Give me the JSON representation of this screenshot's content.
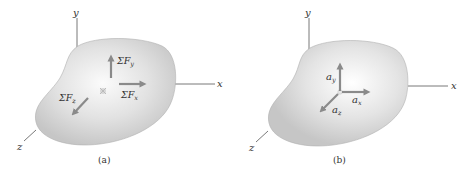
{
  "panels": [
    {
      "caption": "(a)",
      "axes": {
        "x": "x",
        "y": "y",
        "z": "z"
      },
      "vectors": {
        "fy": {
          "sigma": "ΣF",
          "sub": "y"
        },
        "fx": {
          "sigma": "ΣF",
          "sub": "x"
        },
        "fz": {
          "sigma": "ΣF",
          "sub": "z"
        }
      }
    },
    {
      "caption": "(b)",
      "axes": {
        "x": "x",
        "y": "y",
        "z": "z"
      },
      "vectors": {
        "ay": {
          "base": "a",
          "sub": "y"
        },
        "ax": {
          "base": "a",
          "sub": "x"
        },
        "az": {
          "base": "a",
          "sub": "z"
        }
      }
    }
  ],
  "colors": {
    "arrow": "#8a8a8a",
    "blob_edge": "#a9a9a9",
    "blob_fill_center": "#fafafa",
    "blob_fill_edge": "#c9c9c9",
    "axis": "#555555"
  }
}
